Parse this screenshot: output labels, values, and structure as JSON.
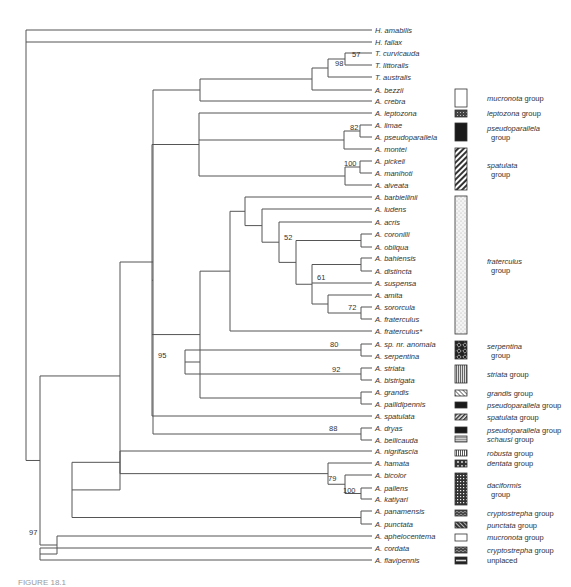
{
  "figure": {
    "type": "phylogenetic-tree",
    "caption_partial": "FIGURE 18.1"
  },
  "tree": {
    "leaves": [
      {
        "label": "H. amabilis",
        "y": 30
      },
      {
        "label": "H. fallax",
        "y": 42
      },
      {
        "label": "T. curvicauda",
        "y": 53
      },
      {
        "label": "T. littoralis",
        "y": 65
      },
      {
        "label": "T. australis",
        "y": 77
      },
      {
        "label": "A. bezzii",
        "y": 90
      },
      {
        "label": "A. crebra",
        "y": 101
      },
      {
        "label": "A. leptozona",
        "y": 113
      },
      {
        "label": "A. limae",
        "y": 125
      },
      {
        "label": "A. pseudoparallela",
        "y": 137
      },
      {
        "label": "A. montei",
        "y": 149
      },
      {
        "label": "A. pickeli",
        "y": 161
      },
      {
        "label": "A. manihoti",
        "y": 173
      },
      {
        "label": "A. alveata",
        "y": 185
      },
      {
        "label": "A. barbiellinii",
        "y": 197
      },
      {
        "label": "A. ludens",
        "y": 209
      },
      {
        "label": "A. acris",
        "y": 222
      },
      {
        "label": "A. coronilli",
        "y": 234
      },
      {
        "label": "A. obliqua",
        "y": 247
      },
      {
        "label": "A. bahiensis",
        "y": 258
      },
      {
        "label": "A. distincta",
        "y": 271
      },
      {
        "label": "A. suspensa",
        "y": 283
      },
      {
        "label": "A. amita",
        "y": 295
      },
      {
        "label": "A. sororcula",
        "y": 307
      },
      {
        "label": "A. fraterculus",
        "y": 319
      },
      {
        "label": "A. fraterculus*",
        "y": 331
      },
      {
        "label": "A. sp. nr. anomala",
        "y": 344
      },
      {
        "label": "A. serpentina",
        "y": 356
      },
      {
        "label": "A. striata",
        "y": 368
      },
      {
        "label": "A. bistrigata",
        "y": 380
      },
      {
        "label": "A. grandis",
        "y": 392
      },
      {
        "label": "A. pallidipennis",
        "y": 404
      },
      {
        "label": "A. spatulata",
        "y": 416
      },
      {
        "label": "A. dryas",
        "y": 428
      },
      {
        "label": "A. bellicauda",
        "y": 440
      },
      {
        "label": "A. nigrifascia",
        "y": 451
      },
      {
        "label": "A. hamata",
        "y": 463
      },
      {
        "label": "A. bicolor",
        "y": 475
      },
      {
        "label": "A. pallens",
        "y": 488
      },
      {
        "label": "A. katiyari",
        "y": 499
      },
      {
        "label": "A. panamensis",
        "y": 511
      },
      {
        "label": "A. punctata",
        "y": 524
      },
      {
        "label": "A. aphelocentema",
        "y": 536
      },
      {
        "label": "A. cordata",
        "y": 548
      },
      {
        "label": "A. flavipennis",
        "y": 560
      }
    ],
    "support_values": [
      {
        "value": "57",
        "x": 352,
        "y": 57
      },
      {
        "value": "98",
        "x": 335,
        "y": 66
      },
      {
        "value": "82",
        "x": 350,
        "y": 130
      },
      {
        "value": "100",
        "x": 344,
        "y": 166
      },
      {
        "value": "52",
        "x": 284,
        "y": 240
      },
      {
        "value": "61",
        "x": 317,
        "y": 280
      },
      {
        "value": "72",
        "x": 348,
        "y": 310
      },
      {
        "value": "80",
        "x": 330,
        "y": 347
      },
      {
        "value": "92",
        "x": 332,
        "y": 372
      },
      {
        "value": "95",
        "x": 158,
        "y": 358
      },
      {
        "value": "88",
        "x": 329,
        "y": 431
      },
      {
        "value": "79",
        "x": 328,
        "y": 481
      },
      {
        "value": "100",
        "x": 343,
        "y": 493
      },
      {
        "value": "97",
        "x": 29,
        "y": 535
      }
    ]
  },
  "legend": {
    "items": [
      {
        "group": "mucronota",
        "suffix": "group",
        "pattern": "white",
        "y": 89,
        "h": 18,
        "multiline": false
      },
      {
        "group": "leptozona",
        "suffix": "group",
        "pattern": "dark-dots",
        "y": 110,
        "h": 7,
        "multiline": false
      },
      {
        "group": "pseudoparallela",
        "suffix": "group",
        "pattern": "solid-black",
        "y": 123,
        "h": 18,
        "multiline": true
      },
      {
        "group": "spatulata",
        "suffix": "group",
        "pattern": "diagonal-hatch",
        "y": 148,
        "h": 42,
        "multiline": true
      },
      {
        "group": "fraterculus",
        "suffix": "group",
        "pattern": "light-stipple",
        "y": 196,
        "h": 138,
        "multiline": true
      },
      {
        "group": "serpentina",
        "suffix": "group",
        "pattern": "diamond-dark",
        "y": 341,
        "h": 18,
        "multiline": true
      },
      {
        "group": "striata",
        "suffix": "group",
        "pattern": "vertical-lines",
        "y": 365,
        "h": 18,
        "multiline": false
      },
      {
        "group": "grandis",
        "suffix": "group",
        "pattern": "light-diag",
        "y": 390,
        "h": 6,
        "multiline": false
      },
      {
        "group": "pseudoparallela",
        "suffix": "group",
        "pattern": "solid-black",
        "y": 402,
        "h": 6,
        "multiline": false
      },
      {
        "group": "spatulata",
        "suffix": "group",
        "pattern": "diagonal-hatch-small",
        "y": 414,
        "h": 6,
        "multiline": false
      },
      {
        "group": "pseudoparallela",
        "suffix": "group",
        "pattern": "solid-black",
        "y": 427,
        "h": 6,
        "multiline": false
      },
      {
        "group": "schausi",
        "suffix": "group",
        "pattern": "gray-lines",
        "y": 436,
        "h": 6,
        "multiline": false
      },
      {
        "group": "robusta",
        "suffix": "group",
        "pattern": "grid",
        "y": 450,
        "h": 6,
        "multiline": false
      },
      {
        "group": "dentata",
        "suffix": "group",
        "pattern": "dark-blobs",
        "y": 460,
        "h": 7,
        "multiline": false
      },
      {
        "group": "daciformis",
        "suffix": "group",
        "pattern": "dark-check",
        "y": 473,
        "h": 32,
        "multiline": true
      },
      {
        "group": "cryptostrepha",
        "suffix": "group",
        "pattern": "dark-wave",
        "y": 510,
        "h": 6,
        "multiline": false
      },
      {
        "group": "punctata",
        "suffix": "group",
        "pattern": "dark-diag",
        "y": 522,
        "h": 6,
        "multiline": false
      },
      {
        "group": "mucronota",
        "suffix": "group",
        "pattern": "white",
        "y": 534,
        "h": 7,
        "multiline": false
      },
      {
        "group": "cryptostrepha",
        "suffix": "group",
        "pattern": "dark-wave",
        "y": 547,
        "h": 6,
        "multiline": false
      },
      {
        "group": "",
        "suffix": "unplaced",
        "pattern": "black-stripe",
        "y": 557,
        "h": 7,
        "multiline": false
      }
    ]
  }
}
